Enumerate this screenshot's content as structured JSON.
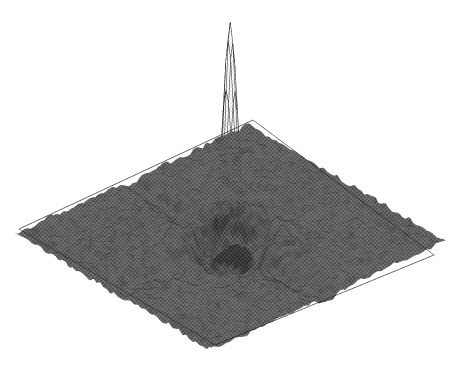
{
  "figure": {
    "width": 454,
    "height": 366,
    "background_color": "#ffffff",
    "title": "",
    "caption": "",
    "axis_labels_visible": false,
    "tick_labels_visible": false,
    "legend_visible": false,
    "render_style": "halftone-scanned-wireframe-mesh"
  },
  "chart_data": {
    "type": "surface",
    "title": "",
    "subtitle": "",
    "xlabel": "",
    "ylabel": "",
    "zlabel": "",
    "grid": false,
    "legend_position": "none",
    "projection": {
      "kind": "isometric-oblique",
      "elevation_deg": 28,
      "azimuth_deg": 45,
      "plane_corners_px": {
        "left": [
          19,
          229
        ],
        "top": [
          253,
          120
        ],
        "right": [
          434,
          255
        ],
        "bottom": [
          215,
          345
        ]
      }
    },
    "grid_resolution": {
      "nx": 96,
      "ny": 96
    },
    "x": {
      "min": -1,
      "max": 1,
      "label": ""
    },
    "y": {
      "min": -1,
      "max": 1,
      "label": ""
    },
    "z": {
      "min": -0.12,
      "max": 1.0,
      "label": "",
      "zlim": [
        -0.15,
        1.05
      ]
    },
    "peak": {
      "center_x": 0.0,
      "center_y": 0.0,
      "height": 1.0,
      "half_width_x": 0.055,
      "half_width_y": 0.055,
      "apex_px": [
        224,
        20
      ],
      "base_span_px": [
        190,
        258
      ],
      "base_y_px": 258,
      "shape": "gaussian-sinc-hybrid"
    },
    "sidelobes": {
      "ring_count": 3,
      "first_ring_amplitude": -0.085,
      "second_ring_amplitude": 0.045,
      "third_ring_amplitude": -0.022,
      "radial_period": 0.17,
      "decay": 2.6
    },
    "ridges": [
      {
        "name": "left-arm",
        "direction_deg": 180,
        "amplitude": -0.075,
        "length": 0.95,
        "width": 0.09
      },
      {
        "name": "right-arm",
        "direction_deg": 0,
        "amplitude": -0.075,
        "length": 0.95,
        "width": 0.09
      },
      {
        "name": "front-arm",
        "direction_deg": 270,
        "amplitude": -0.055,
        "length": 0.7,
        "width": 0.1
      },
      {
        "name": "back-arm",
        "direction_deg": 90,
        "amplitude": -0.04,
        "length": 0.6,
        "width": 0.1
      }
    ],
    "noise": {
      "kind": "speckle",
      "rms_amplitude": 0.014,
      "correlation_length": 0.035
    },
    "surface_shading": {
      "plane_base_gray": "#6d6d6d",
      "plane_dark_gray": "#3a3a3a",
      "plane_light_gray": "#9a9a9a",
      "peak_face_gray": "#e9e9e9",
      "peak_highlight_gray": "#f6f6f6",
      "wire_color": "#1a1a1a",
      "wire_line_width": 0.45,
      "halftone_enabled": true,
      "halftone_cell_px": 2,
      "halftone_strength": 0.42
    },
    "wireframe": {
      "u_line_count": 96,
      "v_line_count": 96,
      "visible_on_plane": true,
      "visible_on_peak": true,
      "hidden_line_removal": true
    }
  },
  "accessibility": {
    "alt_text": "Isometric wireframe mesh surface plot showing a single tall narrow peak at the centre of a square plane, with dark radiating ridge sidelobes and speckle noise on the plane."
  }
}
